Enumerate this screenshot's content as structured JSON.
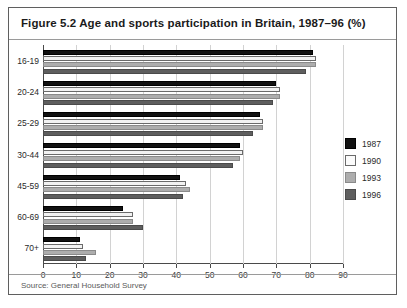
{
  "figure": {
    "title": "Figure 5.2 Age and sports participation in Britain, 1987–96 (%)",
    "source": "Source: General Household Survey"
  },
  "legend": {
    "position": "right",
    "entries": [
      {
        "label": "1987",
        "color": "#111111"
      },
      {
        "label": "1990",
        "color": "#fbfbfb"
      },
      {
        "label": "1993",
        "color": "#adadad"
      },
      {
        "label": "1996",
        "color": "#5e5e5e"
      }
    ]
  },
  "axis": {
    "x_ticks": [
      "0",
      "10",
      "20",
      "30",
      "40",
      "50",
      "60",
      "70",
      "80",
      "90"
    ],
    "y_ticks": [
      "16-19",
      "20-24",
      "25-29",
      "30-44",
      "45-59",
      "60-69",
      "70+"
    ]
  },
  "chart_data": {
    "type": "bar",
    "orientation": "horizontal",
    "title": "Figure 5.2 Age and sports participation in Britain, 1987–96 (%)",
    "xlabel": "",
    "ylabel": "",
    "xlim": [
      0,
      90
    ],
    "grid": true,
    "legend_position": "right",
    "categories": [
      "16-19",
      "20-24",
      "25-29",
      "30-44",
      "45-59",
      "60-69",
      "70+"
    ],
    "series": [
      {
        "name": "1987",
        "color": "#111111",
        "values": [
          81,
          70,
          65,
          59,
          41,
          24,
          11
        ]
      },
      {
        "name": "1990",
        "color": "#fbfbfb",
        "values": [
          82,
          71,
          66,
          60,
          43,
          27,
          12
        ]
      },
      {
        "name": "1993",
        "color": "#adadad",
        "values": [
          82,
          71,
          66,
          59,
          44,
          27,
          16
        ]
      },
      {
        "name": "1996",
        "color": "#5e5e5e",
        "values": [
          79,
          69,
          63,
          57,
          42,
          30,
          13
        ]
      }
    ]
  }
}
